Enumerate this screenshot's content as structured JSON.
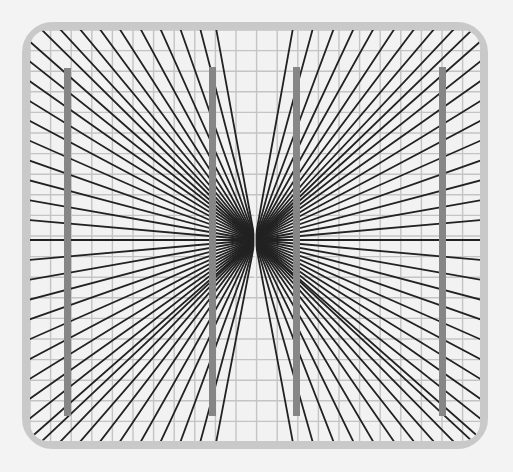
{
  "caption": "",
  "figure": {
    "kind": "hering-illusion",
    "colors": {
      "background": "#f3f3f3",
      "frame": "#c9c9c9",
      "panel": "#f2f2f2",
      "grid": "#c4c4c4",
      "ray": "#222222",
      "bar": "#868686"
    },
    "frame": {
      "x": 22,
      "y": 22,
      "width": 466,
      "height": 427,
      "radius": 26,
      "stroke_width": 9
    },
    "panel": {
      "x": 30,
      "y": 30,
      "width": 450,
      "height": 411
    },
    "center": {
      "x": 255,
      "y": 240
    },
    "grid": {
      "spacing": 20.6,
      "x0": 30,
      "y0": 30
    },
    "rays": {
      "top_x": [
        40,
        59,
        79,
        99,
        119,
        140,
        160,
        180,
        200,
        216,
        293,
        313,
        334,
        354,
        374,
        395,
        415,
        435,
        455,
        474
      ],
      "bottom_x": [
        40,
        59,
        79,
        99,
        119,
        140,
        160,
        180,
        200,
        216,
        293,
        313,
        334,
        354,
        374,
        395,
        415,
        435,
        455,
        474
      ],
      "left_y": [
        40,
        60,
        80,
        100,
        120,
        140,
        160,
        180,
        200,
        220,
        240,
        260,
        280,
        300,
        320,
        340,
        360,
        380,
        400,
        420,
        440
      ],
      "right_y": [
        40,
        60,
        80,
        100,
        120,
        140,
        160,
        180,
        200,
        220,
        240,
        260,
        280,
        300,
        320,
        340,
        360,
        380,
        400,
        420,
        440
      ]
    },
    "bars": [
      {
        "x": 64,
        "y": 68,
        "width": 7,
        "height": 348
      },
      {
        "x": 209,
        "y": 67,
        "width": 7,
        "height": 349
      },
      {
        "x": 293,
        "y": 67,
        "width": 7,
        "height": 349
      },
      {
        "x": 439,
        "y": 67,
        "width": 7,
        "height": 349
      }
    ]
  }
}
